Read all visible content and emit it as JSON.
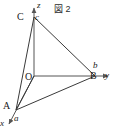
{
  "figure": {
    "caption": "図 2",
    "background_color": "#ffffff",
    "line_color": "#3a3a3a",
    "axis_color": "#555555",
    "text_color": "#1a1a1a",
    "width": 114,
    "height": 137
  },
  "axes": [
    {
      "name": "x-axis",
      "label": "x",
      "direction": "down-left",
      "origin": [
        34,
        76
      ],
      "tip": [
        7,
        126
      ]
    },
    {
      "name": "y-axis",
      "label": "y",
      "direction": "right",
      "origin": [
        34,
        76
      ],
      "tip": [
        110,
        76
      ]
    },
    {
      "name": "z-axis",
      "label": "z",
      "direction": "up",
      "origin": [
        34,
        76
      ],
      "tip": [
        34,
        6
      ]
    }
  ],
  "points": [
    {
      "name": "origin",
      "label": "O",
      "x": 34,
      "y": 76
    },
    {
      "name": "vertex-A",
      "label": "A",
      "intercept_label": "a",
      "axis": "x",
      "x": 16,
      "y": 110
    },
    {
      "name": "vertex-B",
      "label": "B",
      "intercept_label": "b",
      "axis": "y",
      "x": 95,
      "y": 76
    },
    {
      "name": "vertex-C",
      "label": "C",
      "intercept_label": "c",
      "axis": "z",
      "x": 34,
      "y": 17
    }
  ],
  "edges": [
    {
      "name": "edge-CA",
      "from": "C",
      "to": "A"
    },
    {
      "name": "edge-CB",
      "from": "C",
      "to": "B"
    },
    {
      "name": "edge-AB",
      "from": "A",
      "to": "B"
    },
    {
      "name": "edge-OA",
      "from": "O",
      "to": "A"
    }
  ],
  "labels": {
    "vertex_A": "A",
    "vertex_B": "B",
    "vertex_C": "C",
    "intercept_a": "a",
    "intercept_b": "b",
    "intercept_c": "c",
    "origin": "O",
    "axis_x": "x",
    "axis_y": "y",
    "axis_z": "z"
  }
}
